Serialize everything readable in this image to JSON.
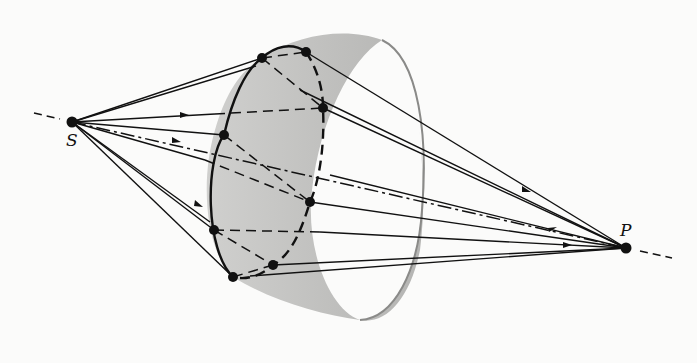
{
  "diagram": {
    "type": "optics-wavefront-paths",
    "labels": {
      "source": "S",
      "point": "P"
    },
    "source": {
      "x": 72,
      "y": 122
    },
    "target": {
      "x": 626,
      "y": 248
    },
    "ring_points": [
      {
        "x": 262,
        "y": 58
      },
      {
        "x": 306,
        "y": 52
      },
      {
        "x": 323,
        "y": 108
      },
      {
        "x": 224,
        "y": 135
      },
      {
        "x": 310,
        "y": 202
      },
      {
        "x": 214,
        "y": 230
      },
      {
        "x": 233,
        "y": 277
      },
      {
        "x": 273,
        "y": 265
      }
    ],
    "colors": {
      "ink": "#111111",
      "surface": "#b9b9b7",
      "rim": "#8a8a88"
    }
  }
}
